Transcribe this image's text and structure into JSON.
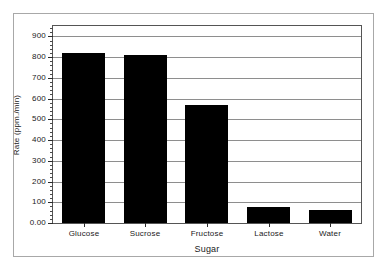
{
  "chart_data": {
    "type": "bar",
    "title": "",
    "xlabel": "Sugar",
    "ylabel": "Rate (ppm./min)",
    "categories": [
      "Glucose",
      "Sucrose",
      "Fructose",
      "Lactose",
      "Water"
    ],
    "values": [
      818,
      808,
      568,
      78,
      65
    ],
    "ylim": [
      0,
      950
    ],
    "ytick_values": [
      0,
      100,
      200,
      300,
      400,
      500,
      600,
      700,
      800,
      900
    ],
    "ytick_labels": [
      "0.00",
      "100",
      "200",
      "300",
      "400",
      "500",
      "600",
      "700",
      "800",
      "900"
    ],
    "minor_ticks_per_major": 5,
    "grid": true,
    "grid_axis": "y",
    "legend": false,
    "bar_color": "#000000",
    "axis_color": "#555555",
    "grid_color": "#8e8e8e",
    "frame_color": "#a8a8a8",
    "text_color": "#1a1a1a",
    "background_color": "#ffffff"
  }
}
